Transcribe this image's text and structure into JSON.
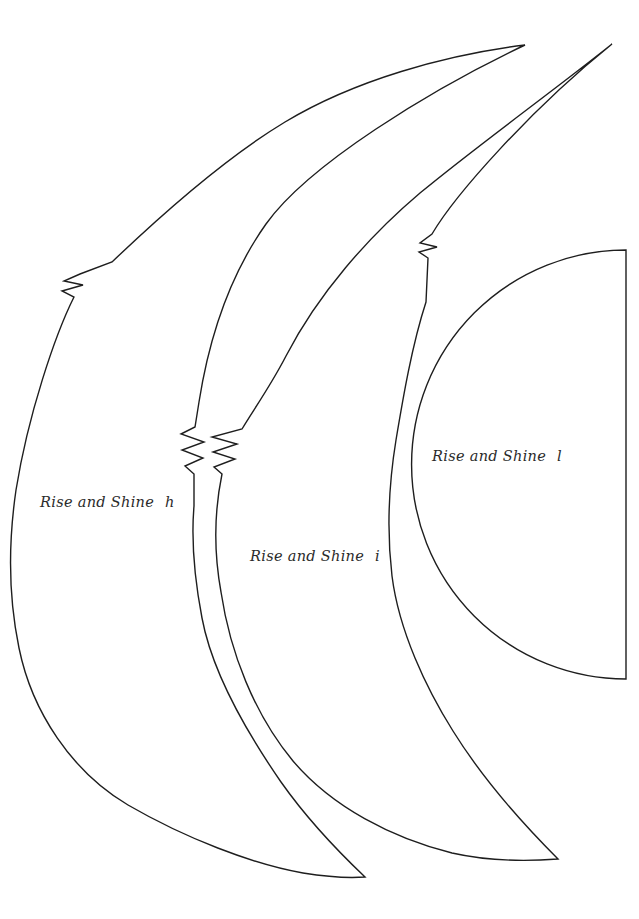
{
  "page": {
    "background_color": "#ffffff",
    "line_color": "#1e1e1e",
    "text_color": "#2b2b2b"
  },
  "pieces": [
    {
      "label": "Rise and Shine",
      "letter": "h",
      "shape": "crescent",
      "notch_marks": "double notch on outer edge, double notches on inner edge"
    },
    {
      "label": "Rise and Shine",
      "letter": "i",
      "shape": "crescent",
      "notch_marks": "double notches on outer edge, notch on inner edge"
    },
    {
      "label": "Rise and Shine",
      "letter": "l",
      "shape": "half-circle with straight right edge"
    }
  ]
}
